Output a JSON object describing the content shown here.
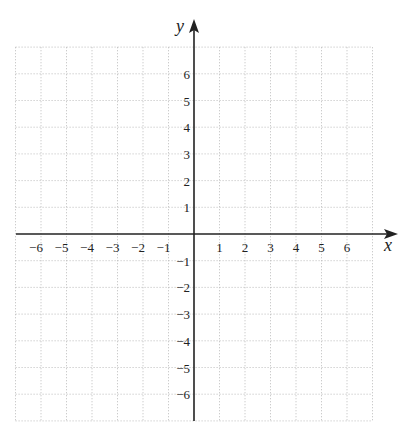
{
  "chart_data": {
    "type": "scatter",
    "title": "",
    "xlabel": "x",
    "ylabel": "y",
    "xlim": [
      -7,
      7
    ],
    "ylim": [
      -7,
      7
    ],
    "grid": true,
    "grid_style": "dotted",
    "x_ticks": [
      -6,
      -5,
      -4,
      -3,
      -2,
      -1,
      1,
      2,
      3,
      4,
      5,
      6
    ],
    "y_ticks": [
      -6,
      -5,
      -4,
      -3,
      -2,
      -1,
      1,
      2,
      3,
      4,
      5,
      6
    ],
    "x_tick_labels": [
      "−6",
      "−5",
      "−4",
      "−3",
      "−2",
      "−1",
      "1",
      "2",
      "3",
      "4",
      "5",
      "6"
    ],
    "y_tick_labels": [
      "−6",
      "−5",
      "−4",
      "−3",
      "−2",
      "−1",
      "1",
      "2",
      "3",
      "4",
      "5",
      "6"
    ],
    "series": [],
    "legend": null,
    "colors": {
      "axis": "#222222",
      "grid": "#b8b8b8",
      "text": "#222222"
    }
  }
}
